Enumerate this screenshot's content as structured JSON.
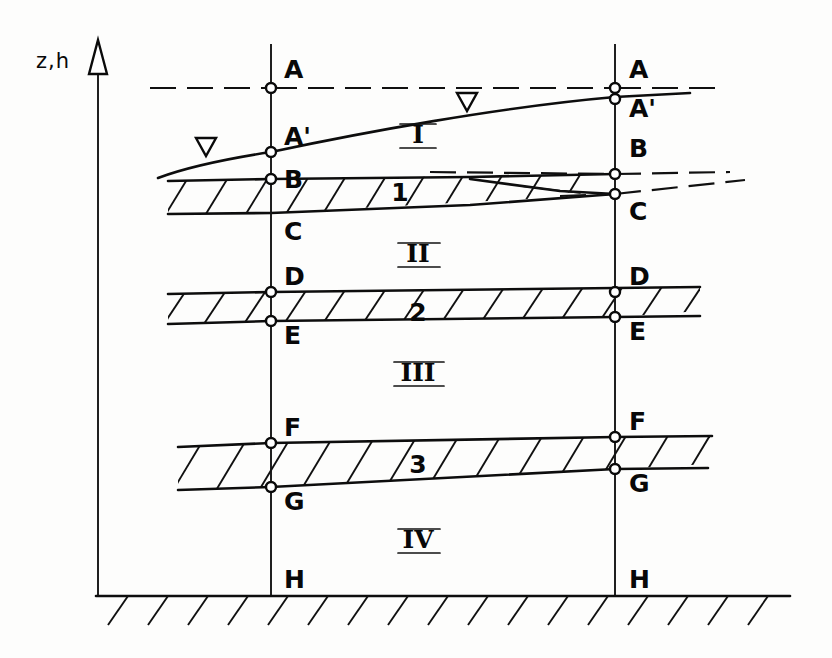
{
  "figure": {
    "domain": "hydrogeology-cross-section",
    "background_color": "#fdfdfc",
    "ink_color": "#0d0d0d"
  },
  "axis": {
    "label": "z,h",
    "arrow_icon": "up-arrow-open-triangle-icon",
    "x": 98,
    "top_y": 44,
    "bottom_y": 596
  },
  "boreholes": [
    {
      "name": "left-borehole",
      "x": 271,
      "top_y": 44,
      "bottom_y": 596
    },
    {
      "name": "right-borehole",
      "x": 615,
      "top_y": 44,
      "bottom_y": 596
    }
  ],
  "point_labels": {
    "left": [
      {
        "id": "A",
        "text": "A",
        "x": 284,
        "y": 78,
        "node_y": 88
      },
      {
        "id": "Ap",
        "text": "A'",
        "x": 284,
        "y": 145,
        "node_y": 152
      },
      {
        "id": "B",
        "text": "B",
        "x": 284,
        "y": 188,
        "node_y": 179
      },
      {
        "id": "C",
        "text": "C",
        "x": 284,
        "y": 236,
        "node_y": 213
      },
      {
        "id": "D",
        "text": "D",
        "x": 284,
        "y": 285,
        "node_y": 292
      },
      {
        "id": "E",
        "text": "E",
        "x": 284,
        "y": 338,
        "node_y": 321
      },
      {
        "id": "F",
        "text": "F",
        "x": 284,
        "y": 434,
        "node_y": 443
      },
      {
        "id": "G",
        "text": "G",
        "x": 284,
        "y": 507,
        "node_y": 487
      },
      {
        "id": "H",
        "text": "H",
        "x": 284,
        "y": 585,
        "node_y": null
      }
    ],
    "right": [
      {
        "id": "A",
        "text": "A",
        "x": 629,
        "y": 78,
        "node_y": 88
      },
      {
        "id": "Ap",
        "text": "A'",
        "x": 629,
        "y": 113,
        "node_y": 97
      },
      {
        "id": "B",
        "text": "B",
        "x": 629,
        "y": 152,
        "node_y": 174
      },
      {
        "id": "C",
        "text": "C",
        "x": 629,
        "y": 212,
        "node_y": 194
      },
      {
        "id": "D",
        "text": "D",
        "x": 629,
        "y": 285,
        "node_y": 292
      },
      {
        "id": "E",
        "text": "E",
        "x": 629,
        "y": 338,
        "node_y": 321
      },
      {
        "id": "F",
        "text": "F",
        "x": 629,
        "y": 434,
        "node_y": 443
      },
      {
        "id": "G",
        "text": "G",
        "x": 629,
        "y": 507,
        "node_y": 487
      },
      {
        "id": "H",
        "text": "H",
        "x": 629,
        "y": 585,
        "node_y": null
      }
    ]
  },
  "zones": [
    {
      "id": "zone-1",
      "text": "I",
      "x": 418,
      "y": 143
    },
    {
      "id": "zone-2",
      "text": "II",
      "x": 418,
      "y": 262
    },
    {
      "id": "zone-3",
      "text": "III",
      "x": 418,
      "y": 381
    },
    {
      "id": "zone-4",
      "text": "IV",
      "x": 418,
      "y": 545
    }
  ],
  "aquitards": [
    {
      "id": "aquitard-1",
      "label": "1",
      "label_x": 400,
      "label_y": 192
    },
    {
      "id": "aquitard-2",
      "label": "2",
      "label_x": 418,
      "label_y": 312
    },
    {
      "id": "aquitard-3",
      "label": "3",
      "label_x": 418,
      "label_y": 465
    }
  ],
  "water_table_markers": [
    {
      "id": "water-table-left",
      "x": 205,
      "y": 146
    },
    {
      "id": "water-table-right",
      "x": 466,
      "y": 101
    }
  ],
  "ground_line": {
    "y": 596,
    "x_start": 98,
    "x_end": 790
  },
  "reference_datum": {
    "id": "datum-dashed-line",
    "y": 88,
    "x_start": 150,
    "x_end": 720
  }
}
